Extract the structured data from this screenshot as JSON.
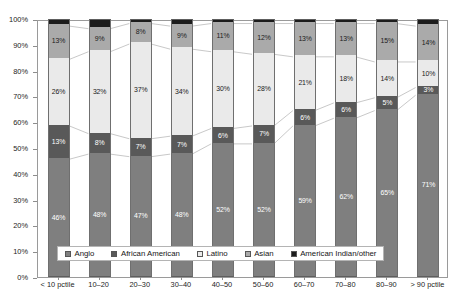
{
  "chart_data": {
    "type": "bar",
    "subtype": "stacked-percentage",
    "title": "",
    "xlabel": "",
    "ylabel": "",
    "ylim": [
      0,
      100
    ],
    "yticks": [
      "0%",
      "10%",
      "20%",
      "30%",
      "40%",
      "50%",
      "60%",
      "70%",
      "80%",
      "90%",
      "100%"
    ],
    "grid": false,
    "legend_position": "bottom-inside",
    "categories": [
      "< 10 pctile",
      "10–20",
      "20–30",
      "30–40",
      "40–50",
      "50–60",
      "60–70",
      "70–80",
      "80–90",
      "> 90 pctile"
    ],
    "series": [
      {
        "name": "Anglo",
        "color": "#7f7f7f",
        "values": [
          46,
          48,
          47,
          48,
          52,
          52,
          59,
          62,
          65,
          71
        ],
        "labels": [
          "46%",
          "48%",
          "47%",
          "48%",
          "52%",
          "52%",
          "59%",
          "62%",
          "65%",
          "71%"
        ],
        "label_color": "light"
      },
      {
        "name": "African American",
        "color": "#595959",
        "values": [
          13,
          8,
          7,
          7,
          6,
          7,
          6,
          6,
          5,
          3
        ],
        "labels": [
          "13%",
          "8%",
          "7%",
          "7%",
          "6%",
          "7%",
          "6%",
          "6%",
          "5%",
          "3%"
        ],
        "label_color": "light"
      },
      {
        "name": "Latino",
        "color": "#eaeaea",
        "values": [
          26,
          32,
          37,
          34,
          30,
          28,
          21,
          18,
          14,
          10
        ],
        "labels": [
          "26%",
          "32%",
          "37%",
          "34%",
          "30%",
          "28%",
          "21%",
          "18%",
          "14%",
          "10%"
        ],
        "label_color": "dark"
      },
      {
        "name": "Asian",
        "color": "#aaaaaa",
        "values": [
          13,
          9,
          8,
          9,
          11,
          12,
          13,
          13,
          15,
          14
        ],
        "labels": [
          "13%",
          "9%",
          "8%",
          "9%",
          "11%",
          "12%",
          "13%",
          "13%",
          "15%",
          "14%"
        ],
        "label_color": "dark"
      },
      {
        "name": "American Indian/other",
        "color": "#1c1c1c",
        "values": [
          2,
          3,
          1,
          2,
          1,
          1,
          1,
          1,
          1,
          2
        ],
        "labels": [
          "",
          "",
          "",
          "",
          "",
          "",
          "",
          "",
          "",
          ""
        ],
        "label_color": "light"
      }
    ]
  },
  "legend": {
    "items": [
      {
        "label": "Anglo",
        "color": "#7f7f7f"
      },
      {
        "label": "African American",
        "color": "#595959"
      },
      {
        "label": "Latino",
        "color": "#eaeaea"
      },
      {
        "label": "Asian",
        "color": "#aaaaaa"
      },
      {
        "label": "American Indian/other",
        "color": "#1c1c1c"
      }
    ]
  }
}
